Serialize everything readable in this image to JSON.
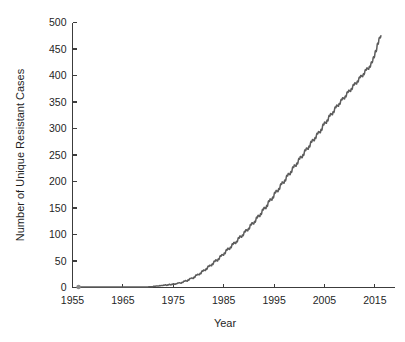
{
  "chart_data": {
    "type": "line",
    "title": "",
    "xlabel": "Year",
    "ylabel": "Number of Unique Resistant Cases",
    "xlim": [
      1955,
      2019
    ],
    "ylim": [
      0,
      500
    ],
    "xticks": [
      1955,
      1965,
      1975,
      1985,
      1995,
      2005,
      2015
    ],
    "xtick_labels": [
      "1955",
      "1965",
      "1975",
      "1985",
      "1995",
      "2005",
      "2015"
    ],
    "yticks": [
      0,
      50,
      100,
      150,
      200,
      250,
      300,
      350,
      400,
      450,
      500
    ],
    "ytick_labels": [
      "0",
      "50",
      "100",
      "150",
      "200",
      "250",
      "300",
      "350",
      "400",
      "450",
      "500"
    ],
    "grid": false,
    "legend": false,
    "line_color": "#5c5c5c",
    "axis_color": "#3c3c3c",
    "text_color": "#1f1f1f",
    "background_color": "#ffffff",
    "series": [
      {
        "name": "Unique Resistant Cases",
        "x": [
          1956.2,
          1957.0,
          1958.0,
          1959.0,
          1960.0,
          1961.0,
          1962.0,
          1963.0,
          1964.0,
          1965.0,
          1966.0,
          1967.0,
          1968.0,
          1969.0,
          1970.0,
          1971.0,
          1971.6,
          1972.2,
          1972.6,
          1973.0,
          1973.4,
          1973.8,
          1974.2,
          1974.6,
          1975.0,
          1975.4,
          1975.8,
          1976.2,
          1976.6,
          1977.0,
          1977.4,
          1977.8,
          1978.2,
          1978.6,
          1979.0,
          1979.4,
          1979.8,
          1980.2,
          1980.6,
          1981.0,
          1981.4,
          1981.8,
          1982.2,
          1982.6,
          1983.0,
          1983.4,
          1983.8,
          1984.2,
          1984.6,
          1985.0,
          1985.4,
          1985.8,
          1986.2,
          1986.6,
          1987.0,
          1987.4,
          1987.8,
          1988.2,
          1988.6,
          1989.0,
          1989.4,
          1989.8,
          1990.2,
          1990.6,
          1991.0,
          1991.4,
          1991.8,
          1992.2,
          1992.6,
          1993.0,
          1993.4,
          1993.8,
          1994.2,
          1994.6,
          1995.0,
          1995.4,
          1995.8,
          1996.2,
          1996.6,
          1997.0,
          1997.4,
          1997.8,
          1998.2,
          1998.6,
          1999.0,
          1999.4,
          1999.8,
          2000.2,
          2000.6,
          2001.0,
          2001.4,
          2001.8,
          2002.2,
          2002.6,
          2003.0,
          2003.4,
          2003.8,
          2004.2,
          2004.6,
          2005.0,
          2005.4,
          2005.8,
          2006.2,
          2006.6,
          2007.0,
          2007.4,
          2007.8,
          2008.2,
          2008.6,
          2009.0,
          2009.4,
          2009.8,
          2010.2,
          2010.6,
          2011.0,
          2011.4,
          2011.8,
          2012.2,
          2012.6,
          2013.0,
          2013.4,
          2013.8,
          2014.2,
          2014.6,
          2015.0,
          2015.4,
          2015.8,
          2016.2
        ],
        "y": [
          1,
          1,
          1,
          1,
          1,
          1,
          1,
          1,
          1,
          1,
          1,
          1,
          1,
          1,
          1,
          2,
          3,
          3,
          4,
          4,
          5,
          4,
          6,
          5,
          7,
          6,
          8,
          9,
          8,
          11,
          13,
          12,
          16,
          18,
          17,
          22,
          25,
          24,
          29,
          33,
          32,
          38,
          42,
          41,
          47,
          52,
          50,
          57,
          62,
          61,
          68,
          74,
          72,
          79,
          85,
          83,
          90,
          97,
          95,
          102,
          109,
          107,
          115,
          122,
          120,
          128,
          136,
          134,
          143,
          151,
          149,
          159,
          167,
          165,
          175,
          183,
          181,
          191,
          199,
          197,
          207,
          215,
          213,
          223,
          231,
          229,
          239,
          247,
          245,
          255,
          263,
          261,
          271,
          279,
          277,
          287,
          294,
          292,
          303,
          312,
          310,
          320,
          328,
          326,
          336,
          344,
          342,
          351,
          358,
          356,
          365,
          372,
          370,
          379,
          386,
          384,
          393,
          400,
          398,
          407,
          414,
          412,
          421,
          429,
          440,
          452,
          468,
          475
        ]
      }
    ]
  },
  "chart": {
    "ylabel_text": "Number of Unique Resistant Cases",
    "xlabel_text": "Year"
  }
}
